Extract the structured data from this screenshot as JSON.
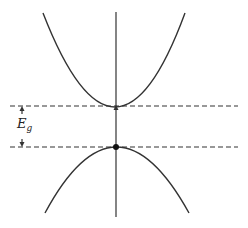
{
  "diagram": {
    "title": "",
    "type": "band-structure",
    "colors": {
      "stroke": "#333333",
      "dash": "#333333",
      "background": "#ffffff"
    },
    "label": {
      "main": "E",
      "subscript": "g"
    },
    "conduction_band": {
      "shape": "upward-parabola",
      "vertex": [
        116,
        107
      ],
      "left_end": [
        43,
        13
      ],
      "right_end": [
        185,
        13
      ]
    },
    "valence_band": {
      "shape": "downward-parabola",
      "vertex": [
        116,
        147
      ],
      "left_end": [
        45,
        213
      ],
      "right_end": [
        189,
        213
      ]
    },
    "conduction_minimum_dashed_line_y": 106,
    "valence_maximum_dashed_line_y": 147,
    "vertical_axis": {
      "x": 116,
      "y_top": 12,
      "y_bottom": 217
    },
    "markers": [
      {
        "name": "conduction-band-minimum",
        "style": "small-arrowhead",
        "pos": [
          116,
          107
        ]
      },
      {
        "name": "valence-band-maximum",
        "style": "filled-dot",
        "pos": [
          116,
          147
        ]
      }
    ]
  }
}
